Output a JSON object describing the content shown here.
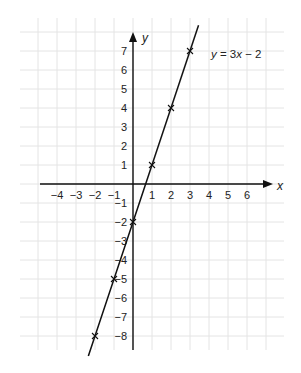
{
  "chart_data": {
    "type": "line",
    "title": "",
    "xlabel": "x",
    "ylabel": "y",
    "xlim": [
      -6,
      7
    ],
    "ylim": [
      -9,
      8
    ],
    "grid": true,
    "x_ticks": [
      -4,
      -3,
      -2,
      -1,
      1,
      2,
      3,
      4,
      5,
      6
    ],
    "y_ticks": [
      7,
      6,
      5,
      4,
      3,
      2,
      1,
      -1,
      -2,
      -3,
      -4,
      -5,
      -6,
      -7,
      -8
    ],
    "series": [
      {
        "name": "y = 3x − 2",
        "equation": "y = 3x − 2",
        "slope": 3,
        "intercept": -2,
        "line_x_range": [
          -2.35,
          3.45
        ],
        "marked_points": [
          {
            "x": -2,
            "y": -8
          },
          {
            "x": -1,
            "y": -5
          },
          {
            "x": 0,
            "y": -2
          },
          {
            "x": 1,
            "y": 1
          },
          {
            "x": 2,
            "y": 4
          },
          {
            "x": 3,
            "y": 7
          }
        ]
      }
    ],
    "annotations": [
      {
        "text_parts": [
          "y",
          " = 3",
          "x",
          " − 2"
        ],
        "position": "upper-right of line"
      }
    ]
  },
  "labels": {
    "x_axis": "x",
    "y_axis": "y",
    "equation_y": "y",
    "equation_mid": " = 3",
    "equation_x": "x",
    "equation_tail": " − 2"
  },
  "colors": {
    "grid": "#e4e4e4",
    "axis": "#111111",
    "line": "#111111",
    "text": "#222222"
  }
}
